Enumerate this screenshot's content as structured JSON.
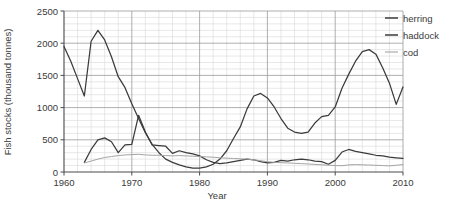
{
  "chart_data": {
    "type": "line",
    "title": "",
    "xlabel": "Year",
    "ylabel": "Fish stocks (thousand tonnes)",
    "xlim": [
      1960,
      2010
    ],
    "ylim": [
      0,
      2500
    ],
    "xticks": [
      1960,
      1970,
      1980,
      1990,
      2000,
      2010
    ],
    "xtick_labels": [
      "1960",
      "1970",
      "1980",
      "1990",
      "2000",
      "2010"
    ],
    "yticks": [
      0,
      500,
      1000,
      1500,
      2000,
      2500
    ],
    "ytick_labels": [
      "0",
      "500",
      "1000",
      "1500",
      "2000",
      "2500"
    ],
    "grid": true,
    "minor_grid": true,
    "legend_position": "right",
    "series": [
      {
        "name": "herring",
        "color": "#3b3b3b",
        "x": [
          1960,
          1961,
          1962,
          1963,
          1964,
          1965,
          1966,
          1967,
          1968,
          1969,
          1970,
          1971,
          1972,
          1973,
          1974,
          1975,
          1976,
          1977,
          1978,
          1979,
          1980,
          1981,
          1982,
          1983,
          1984,
          1985,
          1986,
          1987,
          1988,
          1989,
          1990,
          1991,
          1992,
          1993,
          1994,
          1995,
          1996,
          1997,
          1998,
          1999,
          2000,
          2001,
          2002,
          2003,
          2004,
          2005,
          2006,
          2007,
          2008,
          2009,
          2010
        ],
        "y": [
          1950,
          1720,
          1450,
          1180,
          2030,
          2200,
          2050,
          1790,
          1480,
          1310,
          1060,
          830,
          610,
          430,
          300,
          200,
          150,
          110,
          80,
          60,
          60,
          80,
          120,
          200,
          330,
          520,
          700,
          980,
          1180,
          1220,
          1150,
          1010,
          830,
          680,
          620,
          600,
          620,
          760,
          860,
          880,
          1010,
          1300,
          1520,
          1720,
          1870,
          1900,
          1830,
          1620,
          1380,
          1050,
          1320
        ]
      },
      {
        "name": "haddock",
        "color": "#3b3b3b",
        "x": [
          1963,
          1964,
          1965,
          1966,
          1967,
          1968,
          1969,
          1970,
          1971,
          1972,
          1973,
          1974,
          1975,
          1976,
          1977,
          1978,
          1979,
          1980,
          1981,
          1982,
          1983,
          1984,
          1985,
          1986,
          1987,
          1988,
          1989,
          1990,
          1991,
          1992,
          1993,
          1994,
          1995,
          1996,
          1997,
          1998,
          1999,
          2000,
          2001,
          2002,
          2003,
          2004,
          2005,
          2006,
          2007,
          2008,
          2009,
          2010
        ],
        "y": [
          150,
          350,
          500,
          530,
          470,
          300,
          420,
          430,
          880,
          620,
          420,
          410,
          400,
          290,
          330,
          300,
          280,
          250,
          190,
          150,
          130,
          140,
          160,
          180,
          200,
          190,
          160,
          140,
          150,
          180,
          170,
          190,
          200,
          190,
          170,
          160,
          120,
          180,
          310,
          350,
          320,
          300,
          280,
          260,
          250,
          230,
          220,
          210
        ]
      },
      {
        "name": "cod",
        "color": "#a5a5a5",
        "x": [
          1963,
          1964,
          1965,
          1966,
          1967,
          1968,
          1969,
          1970,
          1971,
          1972,
          1973,
          1974,
          1975,
          1976,
          1977,
          1978,
          1979,
          1980,
          1981,
          1982,
          1983,
          1984,
          1985,
          1986,
          1987,
          1988,
          1989,
          1990,
          1991,
          1992,
          1993,
          1994,
          1995,
          1996,
          1997,
          1998,
          1999,
          2000,
          2001,
          2002,
          2003,
          2004,
          2005,
          2006,
          2007,
          2008,
          2009,
          2010
        ],
        "y": [
          140,
          170,
          200,
          225,
          240,
          255,
          265,
          270,
          275,
          265,
          260,
          260,
          255,
          250,
          255,
          250,
          245,
          240,
          235,
          230,
          220,
          215,
          210,
          205,
          200,
          190,
          175,
          160,
          150,
          145,
          140,
          135,
          130,
          125,
          118,
          112,
          105,
          100,
          98,
          110,
          115,
          112,
          108,
          104,
          100,
          95,
          105,
          115
        ]
      }
    ]
  },
  "legend": {
    "items": [
      {
        "label": "herring"
      },
      {
        "label": "haddock"
      },
      {
        "label": "cod"
      }
    ]
  },
  "axes": {
    "x_title": "Year",
    "y_title": "Fish stocks (thousand tonnes)"
  },
  "colors": {
    "dark_line": "#3b3b3b",
    "light_line": "#a5a5a5",
    "axis": "#4a4a4a",
    "major_grid": "#9a9a9a",
    "minor_grid": "#d8d8d8",
    "background": "#ffffff"
  }
}
